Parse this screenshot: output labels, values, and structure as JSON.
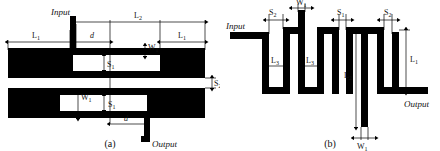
{
  "figure": {
    "colors": {
      "conductor": "#000000",
      "background": "#ffffff",
      "dimension_line": "#000000",
      "label_text": "#111111"
    },
    "panels": [
      {
        "id": "a",
        "caption": "(a)",
        "kind": "parallel-coupled-line-filter",
        "ports": [
          {
            "name": "input-port-label",
            "label": "Input"
          },
          {
            "name": "output-port-label",
            "label": "Output"
          }
        ],
        "dimension_labels": [
          {
            "name": "dim-L1-left",
            "label": "L",
            "sub": "1",
            "kind": "horizontal"
          },
          {
            "name": "dim-L2-top",
            "label": "L",
            "sub": "2",
            "kind": "horizontal"
          },
          {
            "name": "dim-L1-right",
            "label": "L",
            "sub": "1",
            "kind": "horizontal"
          },
          {
            "name": "dim-d-top",
            "label": "d",
            "sub": "",
            "kind": "horizontal"
          },
          {
            "name": "dim-d-bottom",
            "label": "d",
            "sub": "",
            "kind": "horizontal"
          },
          {
            "name": "dim-W1-top",
            "label": "W",
            "sub": "1",
            "kind": "vertical"
          },
          {
            "name": "dim-W1-bottom",
            "label": "W",
            "sub": "1",
            "kind": "vertical"
          },
          {
            "name": "dim-S1-top",
            "label": "S",
            "sub": "1",
            "kind": "vertical"
          },
          {
            "name": "dim-S1-bottom",
            "label": "S",
            "sub": "1",
            "kind": "vertical"
          },
          {
            "name": "dim-S2-right",
            "label": "S",
            "sub": "2",
            "kind": "vertical"
          }
        ]
      },
      {
        "id": "b",
        "caption": "(b)",
        "kind": "meander-line-filter",
        "ports": [
          {
            "name": "input-port-label",
            "label": "Input"
          },
          {
            "name": "output-port-label",
            "label": "Output"
          }
        ],
        "dimension_labels": [
          {
            "name": "dim-S2-left",
            "label": "S",
            "sub": "2",
            "kind": "vertical"
          },
          {
            "name": "dim-W1-top",
            "label": "W",
            "sub": "1",
            "kind": "vertical"
          },
          {
            "name": "dim-S1-mid",
            "label": "S",
            "sub": "1",
            "kind": "vertical"
          },
          {
            "name": "dim-S2-right",
            "label": "S",
            "sub": "2",
            "kind": "vertical"
          },
          {
            "name": "dim-L3-first",
            "label": "L",
            "sub": "3",
            "kind": "horizontal"
          },
          {
            "name": "dim-L3-second",
            "label": "L",
            "sub": "3",
            "kind": "horizontal"
          },
          {
            "name": "dim-L2-mid",
            "label": "L",
            "sub": "2",
            "kind": "horizontal"
          },
          {
            "name": "dim-L1-right",
            "label": "L",
            "sub": "1",
            "kind": "horizontal"
          },
          {
            "name": "dim-W1-bottom",
            "label": "W",
            "sub": "1",
            "kind": "vertical"
          }
        ]
      }
    ]
  }
}
